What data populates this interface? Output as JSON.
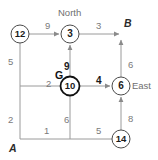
{
  "diagram": {
    "title_visible": false,
    "type": "grid-graph-search",
    "colors": {
      "background": "#ffffff",
      "edge": "#9a9a9a",
      "node_stroke": "#4a4a4a",
      "node_fill": "#ffffff",
      "label_gray": "#7a7a7a",
      "label_dark": "#1a1a1a"
    },
    "compass": {
      "north": "North",
      "east": "East"
    },
    "endpoints": {
      "start": "A",
      "goal": "B"
    },
    "goal_marker": "G",
    "nodes": [
      {
        "id": "n12",
        "label": "12",
        "x": 20,
        "y": 34,
        "r": 9,
        "bold_ring": false
      },
      {
        "id": "n3",
        "label": "3",
        "x": 70,
        "y": 34,
        "r": 9,
        "bold_ring": false
      },
      {
        "id": "n10",
        "label": "10",
        "x": 70,
        "y": 86,
        "r": 9.5,
        "bold_ring": true
      },
      {
        "id": "n6",
        "label": "6",
        "x": 121,
        "y": 86,
        "r": 9,
        "bold_ring": false
      },
      {
        "id": "n14",
        "label": "14",
        "x": 121,
        "y": 139,
        "r": 9,
        "bold_ring": false
      }
    ],
    "edge_labels": [
      {
        "id": "e_12_3",
        "text": "9",
        "x": 45,
        "y": 21,
        "bold": false
      },
      {
        "id": "e_3_B",
        "text": "3",
        "x": 96,
        "y": 21,
        "bold": false
      },
      {
        "id": "e_12_mid",
        "text": "5",
        "x": 8,
        "y": 57,
        "bold": false
      },
      {
        "id": "e_10_3",
        "text": "9",
        "x": 64,
        "y": 62,
        "bold": true
      },
      {
        "id": "e_6_B",
        "text": "6",
        "x": 128,
        "y": 60,
        "bold": false
      },
      {
        "id": "e_left_10",
        "text": "2",
        "x": 46,
        "y": 79,
        "bold": false
      },
      {
        "id": "e_10_6",
        "text": "4",
        "x": 96,
        "y": 76,
        "bold": true
      },
      {
        "id": "e_A_mid",
        "text": "2",
        "x": 8,
        "y": 115,
        "bold": false
      },
      {
        "id": "e_mid_10",
        "text": "6",
        "x": 64,
        "y": 115,
        "bold": false
      },
      {
        "id": "e_14_6",
        "text": "8",
        "x": 128,
        "y": 114,
        "bold": false
      },
      {
        "id": "e_A_bot",
        "text": "1",
        "x": 44,
        "y": 126,
        "bold": false
      },
      {
        "id": "e_bot_14",
        "text": "5",
        "x": 96,
        "y": 126,
        "bold": false
      }
    ]
  }
}
